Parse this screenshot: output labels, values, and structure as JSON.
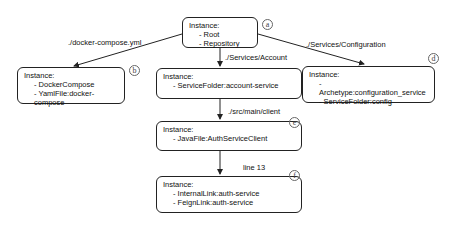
{
  "nodes": [
    {
      "id": "a",
      "title": "Instance:",
      "items": [
        "Root",
        "Repository"
      ],
      "tag": "a"
    },
    {
      "id": "b",
      "title": "Instance:",
      "items": [
        "DockerCompose",
        "YamlFile:docker-compose"
      ],
      "tag": "b"
    },
    {
      "id": "c",
      "title": "Instance:",
      "items": [
        "ServiceFolder:account-service"
      ],
      "tag": "c"
    },
    {
      "id": "d",
      "title": "Instance:",
      "items": [
        "Archetype:configuration_service",
        "ServiceFolder:config"
      ],
      "tag": "d"
    },
    {
      "id": "e",
      "title": "Instance:",
      "items": [
        "JavaFile:AuthServiceClient"
      ],
      "tag": "e"
    },
    {
      "id": "f",
      "title": "Instance:",
      "items": [
        "InternalLink:auth-service",
        "FeignLink:auth-service"
      ],
      "tag": "f"
    }
  ],
  "edges": [
    {
      "from": "a",
      "to": "b",
      "label": "./docker-compose.yml"
    },
    {
      "from": "a",
      "to": "c",
      "label": "./Services/Account"
    },
    {
      "from": "a",
      "to": "d",
      "label": "./Services/Configuration"
    },
    {
      "from": "c",
      "to": "e",
      "label": "./src/main/client"
    },
    {
      "from": "e",
      "to": "f",
      "label": "line 13"
    }
  ]
}
